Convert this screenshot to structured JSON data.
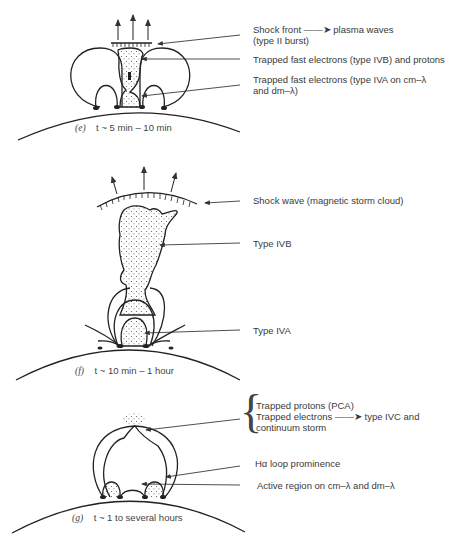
{
  "panels": [
    {
      "id": "e",
      "caption": {
        "letter": "(e)",
        "time": "t ~ 5 min – 10 min"
      },
      "labels": [
        {
          "text_line1": "Shock front ——➤ plasma waves",
          "text_line2": "(type II burst)"
        },
        {
          "text_line1": "Trapped fast electrons (type IVB) and protons"
        },
        {
          "text_line1": "Trapped fast electrons (type IVA on cm–λ",
          "text_line2": "and dm–λ)"
        }
      ]
    },
    {
      "id": "f",
      "caption": {
        "letter": "(f)",
        "time": "t ~ 10 min – 1 hour"
      },
      "labels": [
        {
          "text_line1": "Shock wave (magnetic storm cloud)"
        },
        {
          "text_line1": "Type IVB"
        },
        {
          "text_line1": "Type IVA"
        }
      ]
    },
    {
      "id": "g",
      "caption": {
        "letter": "(g)",
        "time": "t ~ 1 to several hours"
      },
      "labels": [
        {
          "text_line1": "Trapped protons (PCA)",
          "text_line2": "Trapped electrons ——➤ type IVC and",
          "text_line3": "continuum storm"
        },
        {
          "text_line1": "Hα loop prominence"
        },
        {
          "text_line1": "Active region on cm–λ and dm–λ"
        }
      ]
    }
  ]
}
